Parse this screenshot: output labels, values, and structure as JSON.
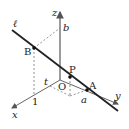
{
  "diagram": {
    "type": "3d-coordinate-line",
    "axes": {
      "x": "x",
      "y": "y",
      "z": "z"
    },
    "origin": "O",
    "line": "ℓ",
    "points": {
      "A": "A",
      "B": "B",
      "P": "P"
    },
    "axis_marks": {
      "a": "a",
      "b": "b",
      "t": "t",
      "one": "1"
    },
    "colors": {
      "line": "#222222",
      "axis": "#555555",
      "dashed": "#777777"
    }
  }
}
